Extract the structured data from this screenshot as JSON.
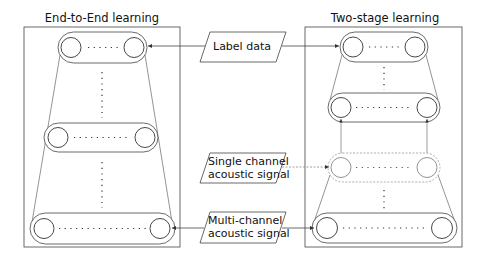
{
  "diagram": {
    "left_panel": {
      "title": "End-to-End learning",
      "layers": [
        {
          "position": "top",
          "nodes": 2,
          "dots": 5
        },
        {
          "position": "middle",
          "nodes": 2,
          "dots": 9
        },
        {
          "position": "bottom",
          "nodes": 2,
          "dots": 14
        }
      ]
    },
    "right_panel": {
      "title": "Two-stage learning",
      "layers": [
        {
          "position": "top",
          "nodes": 2,
          "dots": 5
        },
        {
          "position": "upper-middle",
          "nodes": 2,
          "dots": 9
        },
        {
          "position": "lower-middle",
          "nodes": 2,
          "dots": 9
        },
        {
          "position": "bottom",
          "nodes": 2,
          "dots": 14
        }
      ]
    },
    "inputs": {
      "label_data": "Label data",
      "single_channel_line1": "Single channel",
      "single_channel_line2": "acoustic signal",
      "multi_channel_line1": "Multi-channel",
      "multi_channel_line2": "acoustic signal"
    },
    "edges": [
      {
        "from": "Label data",
        "to": "End-to-End top layer"
      },
      {
        "from": "Label data",
        "to": "Two-stage top layer"
      },
      {
        "from": "Single channel acoustic signal",
        "to": "Two-stage lower-middle layer"
      },
      {
        "from": "Multi-channel acoustic signal",
        "to": "End-to-End bottom layer"
      },
      {
        "from": "Multi-channel acoustic signal",
        "to": "Two-stage bottom layer"
      }
    ],
    "colors": {
      "stroke": "#333333",
      "light_stroke": "#888888",
      "background": "#ffffff"
    }
  }
}
